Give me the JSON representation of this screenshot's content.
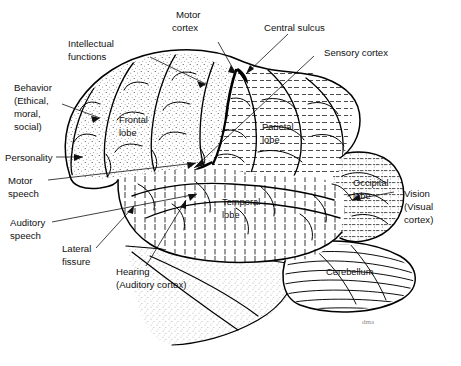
{
  "figure": {
    "background_color": "#ffffff",
    "ink_color": "#000000",
    "signature": "dma"
  },
  "labels": {
    "intellectual_functions": "Intellectual\nfunctions",
    "intellectual_functions_l1": "Intellectual",
    "intellectual_functions_l2": "functions",
    "motor_cortex_l1": "Motor",
    "motor_cortex_l2": "cortex",
    "central_sulcus": "Central sulcus",
    "sensory_cortex": "Sensory cortex",
    "behavior_l1": "Behavior",
    "behavior_l2": "(Ethical,",
    "behavior_l3": "moral,",
    "behavior_l4": "social)",
    "personality": "Personality",
    "motor_speech_l1": "Motor",
    "motor_speech_l2": "speech",
    "auditory_speech_l1": "Auditory",
    "auditory_speech_l2": "speech",
    "lateral_fissure_l1": "Lateral",
    "lateral_fissure_l2": "fissure",
    "hearing_l1": "Hearing",
    "hearing_l2": "(Auditory cortex)",
    "frontal_lobe_l1": "Frontal",
    "frontal_lobe_l2": "lobe",
    "parietal_lobe_l1": "Parietal",
    "parietal_lobe_l2": "lobe",
    "temporal_lobe_l1": "Temporal",
    "temporal_lobe_l2": "lobe",
    "occipital_lobe_l1": "Occipital",
    "occipital_lobe_l2": "lobe",
    "vision_l1": "Vision",
    "vision_l2": "(Visual",
    "vision_l3": "cortex)",
    "cerebellum": "Cerebellum"
  },
  "regions": [
    {
      "name": "frontal-lobe",
      "label": "Frontal lobe",
      "texture": "stipple"
    },
    {
      "name": "parietal-lobe",
      "label": "Parietal lobe",
      "texture": "horizontal-dashed"
    },
    {
      "name": "temporal-lobe",
      "label": "Temporal lobe",
      "texture": "vertical-dashed"
    },
    {
      "name": "occipital-lobe",
      "label": "Occipital lobe",
      "texture": "fine-dashed"
    },
    {
      "name": "cerebellum",
      "label": "Cerebellum",
      "texture": "curved-striations"
    },
    {
      "name": "brainstem",
      "label": "",
      "texture": "stipple"
    }
  ],
  "callouts": [
    {
      "name": "intellectual-functions",
      "side": "left"
    },
    {
      "name": "motor-cortex",
      "side": "top"
    },
    {
      "name": "central-sulcus",
      "side": "top"
    },
    {
      "name": "sensory-cortex",
      "side": "top-right"
    },
    {
      "name": "behavior",
      "side": "left"
    },
    {
      "name": "personality",
      "side": "left"
    },
    {
      "name": "motor-speech",
      "side": "left"
    },
    {
      "name": "auditory-speech",
      "side": "left"
    },
    {
      "name": "lateral-fissure",
      "side": "left"
    },
    {
      "name": "hearing-auditory-cortex",
      "side": "bottom-left"
    },
    {
      "name": "vision-visual-cortex",
      "side": "right"
    }
  ]
}
